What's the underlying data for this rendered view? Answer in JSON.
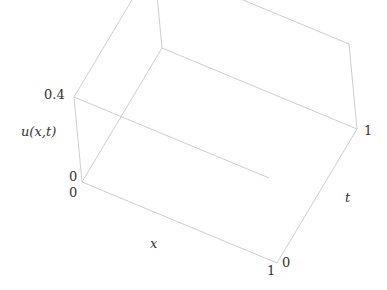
{
  "chart_data": {
    "type": "surface3d",
    "title": "",
    "xlabel": "x",
    "ylabel": "t",
    "zlabel": "u(x,t)",
    "x_range": [
      0,
      1
    ],
    "t_range": [
      0,
      1
    ],
    "z_range": [
      0,
      0.4
    ],
    "x_ticks": [
      "0",
      "1"
    ],
    "t_ticks": [
      "0",
      "1"
    ],
    "z_ticks": [
      "0",
      "0.4"
    ],
    "box": true,
    "grid": false,
    "surface_color": "#4a4a4a",
    "mesh_line_color": "#2e2e2e",
    "box_color": "#c8c8c8",
    "sample_profiles": {
      "x": [
        0,
        0.1,
        0.2,
        0.3,
        0.4,
        0.5,
        0.6,
        0.7,
        0.8,
        0.9,
        1.0
      ],
      "u_t0": [
        0.0,
        0.08,
        0.15,
        0.19,
        0.2,
        0.19,
        0.16,
        0.11,
        0.06,
        0.02,
        0.0
      ],
      "u_t1": [
        0.3,
        0.3,
        0.3,
        0.3,
        0.3,
        0.3,
        0.3,
        0.3,
        0.3,
        0.3,
        0.3
      ]
    }
  },
  "labels": {
    "z_top": "0.4",
    "z_label": "u(x,t)",
    "z_zero": "0",
    "x_zero": "0",
    "x_one": "1",
    "x_label": "x",
    "t_zero": "0",
    "t_one": "1",
    "t_label": "t"
  }
}
